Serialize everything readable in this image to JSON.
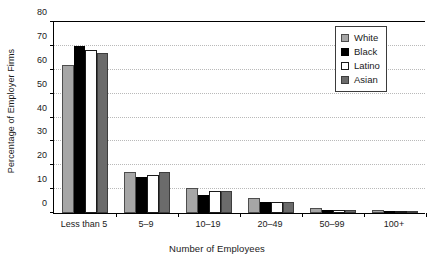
{
  "chart_data": {
    "type": "bar",
    "title": "",
    "xlabel": "Number of Employees",
    "ylabel": "Percentage of Employer Firms",
    "categories": [
      "Less than 5",
      "5–9",
      "10–19",
      "20–49",
      "50–99",
      "100+"
    ],
    "series": [
      {
        "name": "White",
        "color": "#a6a6a6",
        "values": [
          62.0,
          17.3,
          10.5,
          6.3,
          2.0,
          1.2
        ]
      },
      {
        "name": "Black",
        "color": "#000000",
        "values": [
          70.0,
          15.0,
          7.7,
          4.6,
          1.4,
          0.9
        ]
      },
      {
        "name": "Latino",
        "color": "#ffffff",
        "values": [
          68.3,
          15.8,
          9.1,
          4.5,
          1.4,
          0.7
        ]
      },
      {
        "name": "Asian",
        "color": "#6b6b6b",
        "values": [
          67.2,
          17.0,
          9.2,
          4.5,
          1.1,
          0.6
        ]
      }
    ],
    "ylim": [
      0,
      80
    ],
    "yticks": [
      0,
      10,
      20,
      30,
      40,
      50,
      60,
      70,
      80
    ],
    "ytick_labels": [
      "0",
      "10",
      "20",
      "30",
      "40",
      "50",
      "60",
      "70",
      "80"
    ],
    "grid": true,
    "legend_position": "top-right",
    "legend_entries": [
      "White",
      "Black",
      "Latino",
      "Asian"
    ]
  }
}
